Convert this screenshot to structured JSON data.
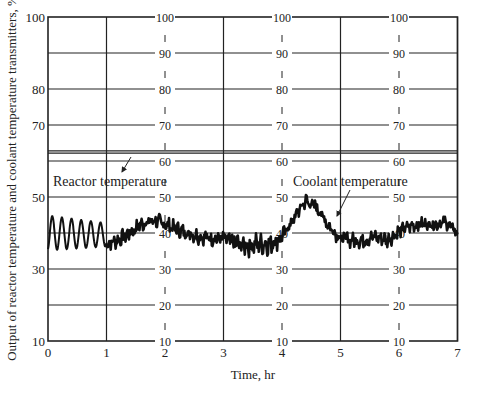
{
  "chart_data": {
    "type": "line",
    "title": "",
    "xlabel": "Time, hr",
    "ylabel": "Output of reactor temperature and coolant temperature transmitters, %",
    "xlim": [
      0,
      7
    ],
    "ylim": [
      10,
      100
    ],
    "grid": true,
    "x_ticks": [
      "0",
      "1",
      "2",
      "3",
      "4",
      "5",
      "6",
      "7"
    ],
    "y_ticks_left": [
      "10",
      "30",
      "50",
      "70",
      "80",
      "100"
    ],
    "y_ticks_inner": [
      "10",
      "20",
      "30",
      "40",
      "50",
      "60",
      "70",
      "80",
      "90",
      "100"
    ],
    "inner_axes_at_x": [
      2,
      4,
      6
    ],
    "horizontal_gridlines": [
      10,
      20,
      30,
      40,
      50,
      60,
      70,
      80,
      90,
      100
    ],
    "vertical_gridlines": [
      1,
      2,
      3,
      4,
      5,
      6,
      7
    ],
    "reference_lines": [
      62.2,
      62.8
    ],
    "annotations": [
      {
        "text": "Reactor temperature",
        "x": 0.25,
        "y": 57,
        "arrow_to": [
          0.8,
          62
        ]
      },
      {
        "text": "Coolant temperature",
        "x": 3.5,
        "y": 57,
        "arrow_to": [
          4.8,
          43
        ]
      }
    ],
    "series": [
      {
        "name": "Transmitter output",
        "description": "Reactor temperature oscillates 35–45% for 0–1 hr, then combined record drifts around 40%",
        "x": [
          0,
          0.08,
          0.16,
          0.25,
          0.33,
          0.42,
          0.5,
          0.58,
          0.67,
          0.75,
          0.83,
          0.92,
          1.0,
          1.2,
          1.4,
          1.6,
          1.8,
          2.0,
          2.2,
          2.4,
          2.6,
          2.8,
          3.0,
          3.2,
          3.4,
          3.6,
          3.8,
          4.0,
          4.2,
          4.4,
          4.6,
          4.8,
          5.0,
          5.2,
          5.4,
          5.6,
          5.8,
          6.0,
          6.2,
          6.4,
          6.6,
          6.8,
          7.0
        ],
        "values": [
          36,
          45,
          35,
          44,
          36,
          44,
          36,
          43,
          37,
          42,
          37,
          41,
          37,
          38,
          40,
          42.5,
          43.5,
          42.5,
          41,
          40,
          39,
          38.5,
          38.5,
          37,
          36.5,
          37,
          37,
          39,
          44,
          49,
          47,
          42,
          38.5,
          38,
          38,
          39,
          38,
          40.5,
          42,
          42.5,
          42.5,
          43,
          40
        ]
      }
    ]
  },
  "labels": {
    "xlabel": "Time, hr",
    "ylabel": "Output of reactor temperature and coolant temperature transmitters, %",
    "reactor": "Reactor temperature",
    "coolant": "Coolant temperature"
  }
}
